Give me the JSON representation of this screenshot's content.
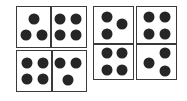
{
  "diagram": {
    "colors": {
      "border": "#3a3a3a",
      "pip": "#262626",
      "background": "#ffffff"
    },
    "tiles": [
      {
        "id": "A",
        "orientation": "horizontal",
        "halves": [
          3,
          4
        ]
      },
      {
        "id": "B",
        "orientation": "horizontal",
        "halves": [
          4,
          3
        ]
      },
      {
        "id": "C",
        "orientation": "vertical",
        "halves": [
          3,
          4
        ]
      },
      {
        "id": "D",
        "orientation": "vertical",
        "halves": [
          4,
          3
        ]
      }
    ]
  }
}
